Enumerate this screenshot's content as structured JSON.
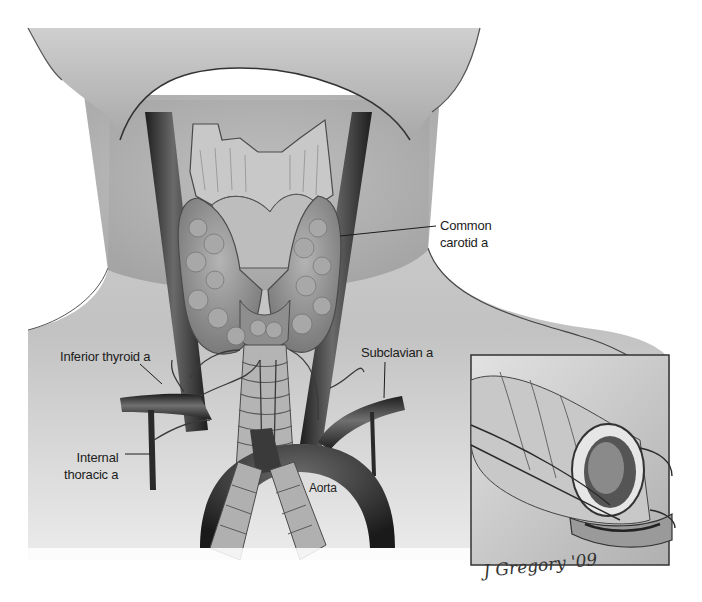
{
  "figure": {
    "colors": {
      "background": "#ffffff",
      "skin_light": "#e6e6e6",
      "skin_mid": "#b9b9b9",
      "vessel_dark": "#2a2a2a",
      "gland": "#9a9a9a",
      "inset_border": "#333333",
      "label_text": "#1c1c1c"
    }
  },
  "labels": {
    "common_carotid": {
      "line1": "Common",
      "line2": "carotid a"
    },
    "inferior_thyroid": {
      "text": "Inferior thyroid a"
    },
    "subclavian": {
      "text": "Subclavian a"
    },
    "internal_thoracic": {
      "line1": "Internal",
      "line2": "thoracic a"
    },
    "aorta": {
      "text": "Aorta"
    }
  },
  "inset": {
    "description": "Cross-section of trachea with blood vessels",
    "signature": "J Gregory '09"
  }
}
